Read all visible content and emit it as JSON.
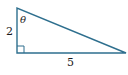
{
  "diagram": {
    "type": "right-triangle",
    "stroke_color": "#2e6f8e",
    "vertices": {
      "top": [
        17,
        8
      ],
      "right_angle": [
        17,
        53
      ],
      "right": [
        126,
        53
      ]
    },
    "labels": {
      "vertical_side": "2",
      "horizontal_side": "5",
      "angle": "θ"
    },
    "right_angle_marker": true
  }
}
